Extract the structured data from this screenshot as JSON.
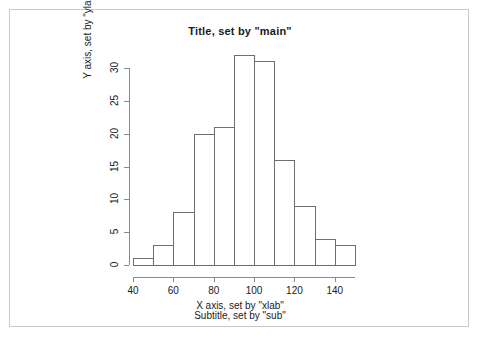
{
  "chart_data": {
    "type": "bar",
    "title": "Title, set by \"main\"",
    "subtitle": "Subtitle, set by \"sub\"",
    "xlabel": "X axis, set by \"xlab\"",
    "ylabel": "Y axis, set by \"ylab\"",
    "bin_edges": [
      40,
      50,
      60,
      70,
      80,
      90,
      100,
      110,
      120,
      130,
      140,
      150
    ],
    "categories": [
      "40-50",
      "50-60",
      "60-70",
      "70-80",
      "80-90",
      "90-100",
      "100-110",
      "110-120",
      "120-130",
      "130-140",
      "140-150"
    ],
    "values": [
      1,
      3,
      8,
      20,
      21,
      32,
      31,
      16,
      9,
      4,
      3
    ],
    "xlim": [
      40,
      150
    ],
    "ylim": [
      0,
      32
    ],
    "xticks": [
      40,
      60,
      80,
      100,
      120,
      140
    ],
    "yticks": [
      0,
      5,
      10,
      15,
      20,
      25,
      30
    ],
    "grid": false,
    "legend": null,
    "bar_fill": "#ffffff",
    "bar_edge_color": "#6e6e6e",
    "axis_color": "#8a8a8a",
    "text_color": "#1a1a1a",
    "background": "#ffffff"
  }
}
